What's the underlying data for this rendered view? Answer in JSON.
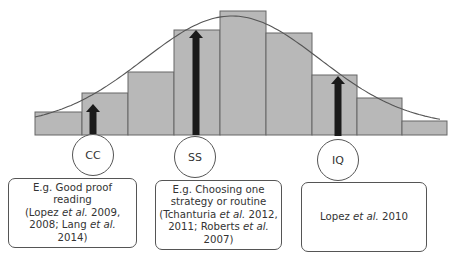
{
  "diagram": {
    "type": "histogram-with-normal-curve",
    "colors": {
      "bar_fill": "#b8b8b8",
      "bar_stroke": "#666666",
      "curve": "#555555",
      "arrow": "#1a1a1a",
      "outline": "#555555"
    },
    "bars": [
      {
        "x": 35,
        "w": 47,
        "top": 112
      },
      {
        "x": 82,
        "w": 46,
        "top": 93
      },
      {
        "x": 128,
        "w": 46,
        "top": 72
      },
      {
        "x": 174,
        "w": 46,
        "top": 30
      },
      {
        "x": 220,
        "w": 46,
        "top": 11
      },
      {
        "x": 266,
        "w": 46,
        "top": 33
      },
      {
        "x": 312,
        "w": 45,
        "top": 75
      },
      {
        "x": 357,
        "w": 45,
        "top": 98
      },
      {
        "x": 402,
        "w": 45,
        "top": 121
      }
    ],
    "baseline": 135,
    "arrows": [
      {
        "x": 93,
        "top": 104,
        "bottom": 134
      },
      {
        "x": 196,
        "top": 30,
        "bottom": 135
      },
      {
        "x": 338,
        "top": 76,
        "bottom": 136
      }
    ],
    "nodes": [
      {
        "id": "cc",
        "label": "CC",
        "cx": 93,
        "cy": 155
      },
      {
        "id": "ss",
        "label": "SS",
        "cx": 195,
        "cy": 157
      },
      {
        "id": "iq",
        "label": "IQ",
        "cx": 338,
        "cy": 160
      }
    ],
    "boxes": [
      {
        "id": "cc",
        "x": 8,
        "y": 178,
        "w": 129,
        "h": 70,
        "lines": [
          {
            "parts": [
              {
                "t": "E.g. Good proof reading"
              }
            ]
          },
          {
            "parts": [
              {
                "t": "(Lopez "
              },
              {
                "t": "et al.",
                "i": true
              },
              {
                "t": " 2009,"
              }
            ]
          },
          {
            "parts": [
              {
                "t": "2008; Lang "
              },
              {
                "t": "et al.",
                "i": true
              }
            ]
          },
          {
            "parts": [
              {
                "t": "2014)"
              }
            ]
          }
        ]
      },
      {
        "id": "ss",
        "x": 155,
        "y": 180,
        "w": 127,
        "h": 70,
        "lines": [
          {
            "parts": [
              {
                "t": "E.g. Choosing one"
              }
            ]
          },
          {
            "parts": [
              {
                "t": "strategy or routine"
              }
            ]
          },
          {
            "parts": [
              {
                "t": "(Tchanturia "
              },
              {
                "t": "et al.",
                "i": true
              },
              {
                "t": " 2012,"
              }
            ]
          },
          {
            "parts": [
              {
                "t": "2011; Roberts "
              },
              {
                "t": "et al.",
                "i": true
              }
            ]
          },
          {
            "parts": [
              {
                "t": "2007)"
              }
            ]
          }
        ]
      },
      {
        "id": "iq",
        "x": 301,
        "y": 182,
        "w": 126,
        "h": 70,
        "lines": [
          {
            "parts": [
              {
                "t": "Lopez "
              },
              {
                "t": "et al.",
                "i": true
              },
              {
                "t": " 2010"
              }
            ]
          }
        ]
      }
    ]
  }
}
